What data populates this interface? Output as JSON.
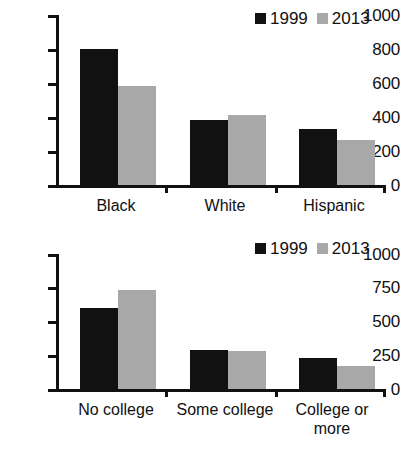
{
  "figure": {
    "panel_count": 2,
    "series_colors": {
      "1999": "#111111",
      "2013": "#a8a8a8"
    },
    "background": "#ffffff"
  },
  "legend": {
    "items": [
      {
        "label": "1999",
        "color": "#111111"
      },
      {
        "label": "2013",
        "color": "#a8a8a8"
      }
    ]
  },
  "chart_data": [
    {
      "type": "bar",
      "title": "",
      "xlabel": "",
      "ylabel": "",
      "categories": [
        "Black",
        "White",
        "Hispanic"
      ],
      "series": [
        {
          "name": "1999",
          "color": "#111111",
          "values": [
            800,
            380,
            330
          ]
        },
        {
          "name": "2013",
          "color": "#a8a8a8",
          "values": [
            580,
            410,
            265
          ]
        }
      ],
      "ylim": [
        0,
        1000
      ],
      "yticks": [
        0,
        200,
        400,
        600,
        800,
        1000
      ],
      "ytick_labels": [
        "0",
        "200",
        "400",
        "600",
        "800",
        "1000"
      ],
      "grid": false,
      "legend_position": "top-right"
    },
    {
      "type": "bar",
      "title": "",
      "xlabel": "",
      "ylabel": "",
      "categories": [
        "No college",
        "Some college",
        "College or more"
      ],
      "category_lines": [
        [
          "No college"
        ],
        [
          "Some college"
        ],
        [
          "College or",
          "more"
        ]
      ],
      "series": [
        {
          "name": "1999",
          "color": "#111111",
          "values": [
            600,
            290,
            230
          ]
        },
        {
          "name": "2013",
          "color": "#a8a8a8",
          "values": [
            730,
            280,
            170
          ]
        }
      ],
      "ylim": [
        0,
        1000
      ],
      "yticks": [
        0,
        250,
        500,
        750,
        1000
      ],
      "ytick_labels": [
        "0",
        "250",
        "500",
        "750",
        "1000"
      ],
      "grid": false,
      "legend_position": "top-right"
    }
  ]
}
